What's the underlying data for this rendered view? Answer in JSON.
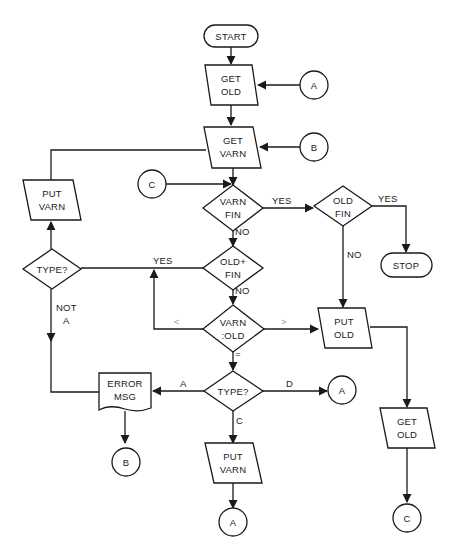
{
  "diagram": {
    "type": "flowchart",
    "colors": {
      "stroke": "#1a1a1a",
      "background": "#ffffff",
      "faint_label": "#9a9a9a"
    },
    "nodes": {
      "start": {
        "shape": "terminal",
        "label": "START"
      },
      "get_old_1": {
        "shape": "io",
        "line1": "GET",
        "line2": "OLD"
      },
      "get_varn": {
        "shape": "io",
        "line1": "GET",
        "line2": "VARN"
      },
      "varn_fin": {
        "shape": "decision",
        "line1": "VARN",
        "line2": "FIN"
      },
      "old_fin": {
        "shape": "decision",
        "line1": "OLD",
        "line2": "FIN"
      },
      "stop": {
        "shape": "terminal",
        "label": "STOP"
      },
      "old_plus_fin": {
        "shape": "decision",
        "line1": "OLD+",
        "line2": "FIN"
      },
      "varn_cmp_old": {
        "shape": "decision",
        "line1": "VARN",
        "line2": ":OLD"
      },
      "put_old": {
        "shape": "io",
        "line1": "PUT",
        "line2": "OLD"
      },
      "get_old_2": {
        "shape": "io",
        "line1": "GET",
        "line2": "OLD"
      },
      "type_center": {
        "shape": "decision",
        "label": "TYPE?"
      },
      "error_msg": {
        "shape": "document",
        "line1": "ERROR",
        "line2": "MSG"
      },
      "put_varn_center": {
        "shape": "io",
        "line1": "PUT",
        "line2": "VARN"
      },
      "type_left": {
        "shape": "decision",
        "label": "TYPE?"
      },
      "put_varn_left": {
        "shape": "io",
        "line1": "PUT",
        "line2": "VARN"
      }
    },
    "connectors": {
      "a_top": "A",
      "b_top": "B",
      "c_left": "C",
      "a_right": "A",
      "b_bottom": "B",
      "a_bottom": "A",
      "c_bottom": "C"
    },
    "edge_labels": {
      "varn_fin_yes": "YES",
      "varn_fin_no": "NO",
      "old_fin_yes": "YES",
      "old_fin_no": "NO",
      "old_plus_fin_yes": "YES",
      "old_plus_fin_no": "NO",
      "cmp_less": "<",
      "cmp_greater": ">",
      "cmp_equal": "=",
      "type_a": "A",
      "type_c": "C",
      "type_d": "D",
      "not_a_line1": "NOT",
      "not_a_line2": "A"
    }
  }
}
